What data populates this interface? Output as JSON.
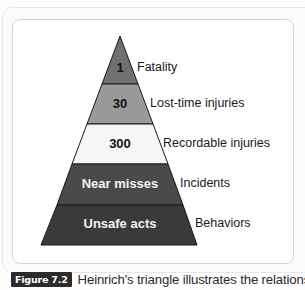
{
  "diagram": {
    "title": "Heinrich's triangle",
    "tiers": [
      {
        "value": "1",
        "label": "Fatality",
        "fill": "#707070",
        "text_color": "#111111"
      },
      {
        "value": "30",
        "label": "Lost-time injuries",
        "fill": "#9a9a9a",
        "text_color": "#111111"
      },
      {
        "value": "300",
        "label": "Recordable injuries",
        "fill": "#f5f5f5",
        "text_color": "#111111"
      },
      {
        "value": "Near misses",
        "label": "Incidents",
        "fill": "#4a4a4a",
        "text_color": "#f2f2f2"
      },
      {
        "value": "Unsafe acts",
        "label": "Behaviors",
        "fill": "#3a3a3a",
        "text_color": "#f2f2f2"
      }
    ]
  },
  "caption": {
    "figure_label": "Figure 7.2",
    "text": "Heinrich's triangle illustrates the relationship of"
  }
}
